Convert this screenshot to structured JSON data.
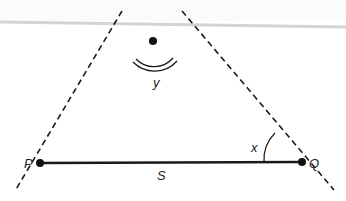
{
  "diagram": {
    "type": "triangle-geometry",
    "labels": {
      "vertex_left": "P",
      "vertex_right": "Q",
      "side_bottom": "S",
      "angle_right": "x",
      "angle_top": "y"
    },
    "points": {
      "apex": [
        153,
        41
      ],
      "P": [
        40,
        163
      ],
      "Q": [
        302,
        162
      ]
    },
    "colors": {
      "line": "#1a1a1a",
      "band": "#d6d6d6",
      "background": "#ffffff"
    }
  }
}
